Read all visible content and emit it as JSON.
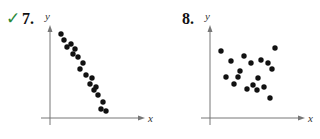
{
  "chart_data": [
    {
      "type": "scatter",
      "number": "7.",
      "checked": true,
      "xlabel": "x",
      "ylabel": "y",
      "grid": false,
      "note": "Strong negative linear correlation; pixel coordinates within panel",
      "points": [
        [
          61,
          34
        ],
        [
          64,
          40
        ],
        [
          67,
          47
        ],
        [
          71,
          44
        ],
        [
          75,
          49
        ],
        [
          73,
          54
        ],
        [
          78,
          57
        ],
        [
          83,
          63
        ],
        [
          80,
          69
        ],
        [
          86,
          75
        ],
        [
          92,
          78
        ],
        [
          90,
          84
        ],
        [
          96,
          87
        ],
        [
          94,
          90
        ],
        [
          98,
          95
        ],
        [
          103,
          102
        ],
        [
          101,
          109
        ],
        [
          106,
          111
        ]
      ]
    },
    {
      "type": "scatter",
      "number": "8.",
      "checked": false,
      "xlabel": "x",
      "ylabel": "y",
      "grid": false,
      "note": "No apparent correlation; pixel coordinates within panel",
      "points": [
        [
          61,
          51
        ],
        [
          71,
          61
        ],
        [
          84,
          56
        ],
        [
          91,
          63
        ],
        [
          101,
          60
        ],
        [
          108,
          63
        ],
        [
          115,
          48
        ],
        [
          112,
          69
        ],
        [
          80,
          71
        ],
        [
          66,
          77
        ],
        [
          78,
          77
        ],
        [
          98,
          78
        ],
        [
          74,
          84
        ],
        [
          93,
          85
        ],
        [
          104,
          87
        ],
        [
          87,
          89
        ],
        [
          97,
          90
        ],
        [
          110,
          98
        ]
      ]
    }
  ],
  "labels": {
    "check": "✓",
    "p7": "7.",
    "p8": "8."
  }
}
